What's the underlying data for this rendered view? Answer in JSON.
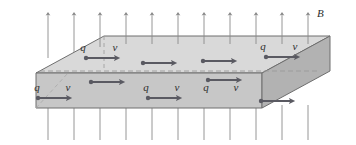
{
  "figure": {
    "type": "physics-diagram",
    "width": 356,
    "height": 145,
    "background_color": "#ffffff"
  },
  "labels": {
    "field_label": "B",
    "charge_label": "q",
    "velocity_label": "v"
  },
  "colors": {
    "slab_top_face": "#d8d8d8",
    "slab_front_face": "#c6c6c6",
    "slab_right_face": "#b0b0b0",
    "slab_left_face": "#cfcfcf",
    "outline": "#6e6e6e",
    "dashed_edge": "#9a9a9a",
    "field_line": "#8a8a8a",
    "carrier_arrow": "#5a5a62",
    "text": "#2e2e2e"
  },
  "slab": {
    "description": "Rectangular conducting slab drawn in oblique projection",
    "top_face_points": "36,73 104,36 330,36 262,73",
    "front_face_points": "36,73 262,73 262,108 36,108",
    "right_face_points": "262,73 330,36 330,71 262,108",
    "hidden_back_bottom_edge": {
      "x1": 104,
      "y1": 108,
      "x2": 330,
      "y2": 108
    },
    "hidden_left_vertical_edge": {
      "x1": 104,
      "y1": 36,
      "x2": 104,
      "y2": 108
    },
    "interior_dashed_edge": {
      "x1": 40,
      "y1": 71,
      "x2": 326,
      "y2": 71
    }
  },
  "field_lines": {
    "label": "B field lines",
    "count": 11,
    "direction": "upward",
    "x_positions": [
      48,
      74,
      100,
      126,
      152,
      178,
      204,
      230,
      256,
      282,
      308
    ],
    "top_segment": {
      "y_start": 52,
      "y_end": 12,
      "arrowhead": true
    },
    "bottom_segment": {
      "y_start": 140,
      "y_end": 105,
      "arrowhead": false
    },
    "arrowhead_size": 3.4
  },
  "carriers": {
    "description": "Charge carriers q drifting with velocity v toward the right",
    "top_face_row": [
      {
        "x": 86,
        "y": 57,
        "length": 34,
        "labeled": true
      },
      {
        "x": 143,
        "y": 62,
        "length": 34,
        "labeled": false
      },
      {
        "x": 203,
        "y": 60,
        "length": 34,
        "labeled": false
      },
      {
        "x": 266,
        "y": 56,
        "length": 34,
        "labeled": true
      }
    ],
    "front_face_upper_row": [
      {
        "x": 91,
        "y": 81,
        "length": 32,
        "labeled": false
      },
      {
        "x": 208,
        "y": 79,
        "length": 32,
        "labeled": false
      }
    ],
    "front_face_lower_row": [
      {
        "x": 38,
        "y": 97,
        "length": 32,
        "labeled": true
      },
      {
        "x": 148,
        "y": 97,
        "length": 32,
        "labeled": true
      },
      {
        "x": 205,
        "y": 95,
        "length": 32,
        "labeled": true
      },
      {
        "x": 261,
        "y": 100,
        "length": 32,
        "labeled": false
      }
    ]
  },
  "field_label_position": {
    "x": 315,
    "y": 16
  }
}
